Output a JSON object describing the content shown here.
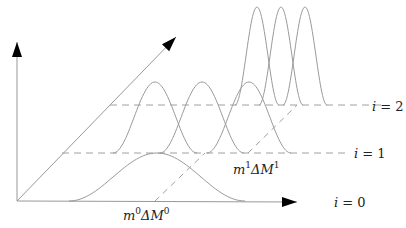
{
  "diagram": {
    "axes": {
      "origin": [
        17,
        201
      ],
      "vertical_end": [
        17,
        42
      ],
      "horizontal_end": [
        297,
        202
      ],
      "diagonal_end": [
        176,
        37
      ],
      "color": "#999999",
      "arrow_color": "#000000"
    },
    "levels": [
      {
        "index": 0,
        "label": "i = 0",
        "label_pos": [
          334,
          207
        ],
        "baseline_y": 201,
        "dashed_line": null,
        "curves": [
          {
            "center": 157,
            "half_width": 88,
            "height": 48
          }
        ],
        "annotation": {
          "text_m": "m",
          "sup1": "0",
          "text_d": "ΔM",
          "sup2": "0",
          "pos": [
            123,
            220
          ]
        }
      },
      {
        "index": 1,
        "label": "i = 1",
        "label_pos": [
          354,
          158
        ],
        "baseline_y": 153,
        "dashed_line": [
          62,
          345
        ],
        "curves": [
          {
            "center": 155,
            "half_width": 42,
            "height": 71
          },
          {
            "center": 202,
            "half_width": 42,
            "height": 71
          },
          {
            "center": 249,
            "half_width": 42,
            "height": 71
          }
        ],
        "annotation": {
          "text_m": "m",
          "sup1": "1",
          "text_d": "ΔM",
          "sup2": "1",
          "pos": [
            233,
            174
          ]
        }
      },
      {
        "index": 2,
        "label": "i = 2",
        "label_pos": [
          372,
          111
        ],
        "baseline_y": 105,
        "dashed_line": [
          110,
          385
        ],
        "curves": [
          {
            "center": 257,
            "half_width": 22,
            "height": 98
          },
          {
            "center": 281,
            "half_width": 22,
            "height": 98
          },
          {
            "center": 305,
            "half_width": 22,
            "height": 98
          }
        ],
        "annotation": null
      }
    ],
    "diagonal_dashes": [
      {
        "from": [
          155,
          201
        ],
        "to": [
          205,
          153
        ]
      },
      {
        "from": [
          248,
          153
        ],
        "to": [
          297,
          105
        ]
      }
    ],
    "curve_color": "#9a9a9a",
    "dash_color": "#a0a0a0"
  }
}
